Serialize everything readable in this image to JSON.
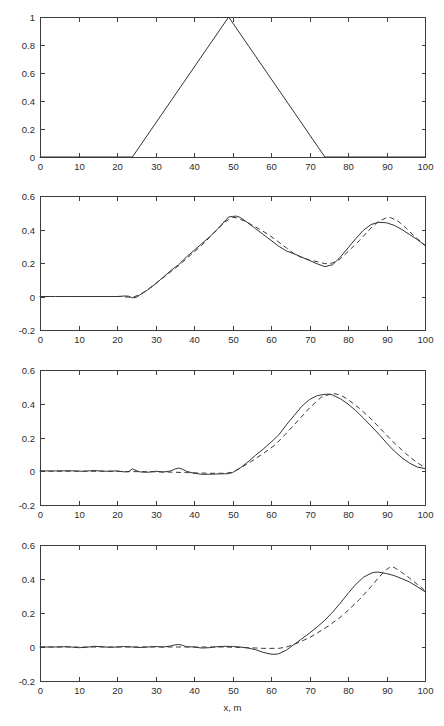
{
  "figure": {
    "title": "",
    "background": "#ffffff",
    "axis_color": "#3d3d3d",
    "solid_color": "#333333",
    "dashed_color": "#3a3a3a",
    "xlabel": "x, m",
    "panel_count": 4
  },
  "chart_data": [
    {
      "type": "line",
      "panel": 1,
      "title": "",
      "xlabel": "",
      "ylabel": "",
      "xlim": [
        0,
        100
      ],
      "ylim": [
        0,
        1
      ],
      "xticks": [
        0,
        10,
        20,
        30,
        40,
        50,
        60,
        70,
        80,
        90,
        100
      ],
      "xticklabels": [
        "0",
        "10",
        "20",
        "30",
        "40",
        "50",
        "60",
        "70",
        "80",
        "90",
        "100"
      ],
      "yticks": [
        0,
        0.2,
        0.4,
        0.6,
        0.8,
        1
      ],
      "yticklabels": [
        "0",
        "0.2",
        "0.4",
        "0.6",
        "0.8",
        "1"
      ],
      "grid": false,
      "legend": null,
      "series": [
        {
          "name": "initial triangular pulse",
          "style": "solid",
          "x": [
            0,
            24,
            49,
            74,
            100
          ],
          "y": [
            0,
            0,
            1,
            0,
            0
          ]
        }
      ]
    },
    {
      "type": "line",
      "panel": 2,
      "title": "",
      "xlabel": "",
      "ylabel": "",
      "xlim": [
        0,
        100
      ],
      "ylim": [
        -0.2,
        0.6
      ],
      "xticks": [
        0,
        10,
        20,
        30,
        40,
        50,
        60,
        70,
        80,
        90,
        100
      ],
      "xticklabels": [
        "0",
        "10",
        "20",
        "30",
        "40",
        "50",
        "60",
        "70",
        "80",
        "90",
        "100"
      ],
      "yticks": [
        -0.2,
        0,
        0.2,
        0.4,
        0.6
      ],
      "yticklabels": [
        "-0.2",
        "0",
        "0.2",
        "0.4",
        "0.6"
      ],
      "grid": false,
      "legend": null,
      "series": [
        {
          "name": "numerical",
          "style": "solid",
          "x": [
            0,
            4,
            8,
            12,
            16,
            18,
            20,
            22,
            23,
            24,
            25,
            26,
            28,
            30,
            32,
            34,
            36,
            38,
            40,
            42,
            44,
            46,
            48,
            49,
            50,
            51,
            52,
            54,
            56,
            58,
            60,
            62,
            64,
            66,
            68,
            70,
            72,
            74,
            76,
            78,
            80,
            82,
            84,
            86,
            88,
            90,
            92,
            94,
            96,
            98,
            100
          ],
          "y": [
            0.0,
            0.0,
            0.0,
            0.0,
            0.0,
            0.0,
            0.0,
            0.003,
            0.002,
            -0.008,
            -0.005,
            0.01,
            0.04,
            0.075,
            0.115,
            0.155,
            0.19,
            0.235,
            0.275,
            0.315,
            0.355,
            0.4,
            0.45,
            0.475,
            0.478,
            0.48,
            0.472,
            0.44,
            0.405,
            0.37,
            0.335,
            0.3,
            0.272,
            0.255,
            0.235,
            0.215,
            0.195,
            0.178,
            0.19,
            0.235,
            0.29,
            0.345,
            0.395,
            0.43,
            0.443,
            0.44,
            0.425,
            0.4,
            0.37,
            0.34,
            0.305
          ]
        },
        {
          "name": "analytical",
          "style": "dashed",
          "x": [
            0,
            6,
            12,
            18,
            21,
            23,
            24,
            26,
            28,
            30,
            33,
            36,
            39,
            42,
            45,
            48,
            50,
            51,
            53,
            56,
            59,
            62,
            64,
            66,
            68,
            70,
            72,
            74,
            76,
            78,
            80,
            83,
            86,
            88,
            90,
            91,
            93,
            95,
            97,
            100
          ],
          "y": [
            0.0,
            0.0,
            0.0,
            0.0,
            0.0,
            -0.004,
            -0.006,
            0.012,
            0.042,
            0.077,
            0.13,
            0.185,
            0.245,
            0.305,
            0.375,
            0.445,
            0.472,
            0.47,
            0.452,
            0.415,
            0.375,
            0.325,
            0.29,
            0.255,
            0.232,
            0.218,
            0.208,
            0.196,
            0.2,
            0.225,
            0.268,
            0.335,
            0.41,
            0.45,
            0.47,
            0.472,
            0.45,
            0.41,
            0.365,
            0.305
          ]
        }
      ]
    },
    {
      "type": "line",
      "panel": 3,
      "title": "",
      "xlabel": "",
      "ylabel": "",
      "xlim": [
        0,
        100
      ],
      "ylim": [
        -0.2,
        0.6
      ],
      "xticks": [
        0,
        10,
        20,
        30,
        40,
        50,
        60,
        70,
        80,
        90,
        100
      ],
      "xticklabels": [
        "0",
        "10",
        "20",
        "30",
        "40",
        "50",
        "60",
        "70",
        "80",
        "90",
        "100"
      ],
      "yticks": [
        -0.2,
        0,
        0.2,
        0.4,
        0.6
      ],
      "yticklabels": [
        "-0.2",
        "0",
        "0.2",
        "0.4",
        "0.6"
      ],
      "grid": false,
      "legend": null,
      "series": [
        {
          "name": "numerical",
          "style": "solid",
          "x": [
            0,
            4,
            8,
            11,
            14,
            17,
            20,
            22,
            23,
            24,
            25,
            26,
            28,
            30,
            32,
            34,
            35,
            36,
            37,
            38,
            40,
            42,
            44,
            46,
            48,
            49,
            50,
            52,
            54,
            56,
            58,
            60,
            62,
            64,
            66,
            68,
            70,
            72,
            74,
            75,
            76,
            78,
            80,
            82,
            84,
            86,
            88,
            90,
            92,
            94,
            96,
            98,
            100
          ],
          "y": [
            0.002,
            0.002,
            0.003,
            0.0,
            0.004,
            0.0,
            0.002,
            -0.004,
            -0.003,
            0.014,
            0.004,
            -0.004,
            -0.006,
            0.0,
            -0.005,
            0.002,
            0.013,
            0.019,
            0.012,
            0.0,
            -0.012,
            -0.018,
            -0.018,
            -0.016,
            -0.015,
            -0.014,
            -0.008,
            0.02,
            0.055,
            0.095,
            0.132,
            0.172,
            0.215,
            0.275,
            0.33,
            0.385,
            0.425,
            0.448,
            0.456,
            0.457,
            0.452,
            0.43,
            0.398,
            0.36,
            0.315,
            0.268,
            0.22,
            0.168,
            0.12,
            0.08,
            0.048,
            0.025,
            0.016
          ]
        },
        {
          "name": "analytical",
          "style": "dashed",
          "x": [
            0,
            8,
            16,
            24,
            32,
            38,
            44,
            48,
            50,
            52,
            55,
            58,
            61,
            64,
            67,
            70,
            73,
            76,
            78,
            80,
            83,
            86,
            89,
            92,
            95,
            98,
            100
          ],
          "y": [
            0.0,
            0.0,
            0.0,
            -0.002,
            -0.004,
            -0.008,
            -0.012,
            -0.012,
            -0.006,
            0.018,
            0.06,
            0.105,
            0.155,
            0.225,
            0.3,
            0.375,
            0.438,
            0.462,
            0.452,
            0.425,
            0.372,
            0.31,
            0.238,
            0.168,
            0.105,
            0.05,
            0.022
          ]
        }
      ]
    },
    {
      "type": "line",
      "panel": 4,
      "title": "",
      "xlabel": "x, m",
      "ylabel": "",
      "xlim": [
        0,
        100
      ],
      "ylim": [
        -0.2,
        0.6
      ],
      "xticks": [
        0,
        10,
        20,
        30,
        40,
        50,
        60,
        70,
        80,
        90,
        100
      ],
      "xticklabels": [
        "0",
        "10",
        "20",
        "30",
        "40",
        "50",
        "60",
        "70",
        "80",
        "90",
        "100"
      ],
      "yticks": [
        -0.2,
        0,
        0.2,
        0.4,
        0.6
      ],
      "yticklabels": [
        "-0.2",
        "0",
        "0.2",
        "0.4",
        "0.6"
      ],
      "grid": false,
      "legend": null,
      "series": [
        {
          "name": "numerical",
          "style": "solid",
          "x": [
            0,
            4,
            7,
            10,
            12,
            14,
            16,
            18,
            20,
            22,
            24,
            26,
            28,
            30,
            32,
            34,
            35,
            36,
            37,
            38,
            40,
            42,
            44,
            46,
            48,
            50,
            52,
            54,
            56,
            58,
            60,
            61,
            62,
            64,
            66,
            68,
            70,
            72,
            74,
            76,
            78,
            80,
            82,
            84,
            86,
            87,
            88,
            90,
            92,
            94,
            96,
            98,
            100
          ],
          "y": [
            0.0,
            0.0,
            0.002,
            -0.004,
            -0.002,
            0.004,
            0.002,
            -0.002,
            0.0,
            0.003,
            0.0,
            -0.003,
            0.0,
            0.003,
            0.0,
            0.006,
            0.012,
            0.015,
            0.01,
            0.002,
            0.0,
            -0.006,
            -0.004,
            0.002,
            0.004,
            0.003,
            0.0,
            -0.006,
            -0.016,
            -0.032,
            -0.042,
            -0.043,
            -0.04,
            -0.018,
            0.015,
            0.048,
            0.082,
            0.118,
            0.158,
            0.205,
            0.258,
            0.315,
            0.368,
            0.41,
            0.434,
            0.44,
            0.44,
            0.432,
            0.42,
            0.402,
            0.382,
            0.355,
            0.325
          ]
        },
        {
          "name": "analytical",
          "style": "dashed",
          "x": [
            0,
            10,
            20,
            30,
            40,
            48,
            54,
            58,
            62,
            64,
            66,
            68,
            70,
            72,
            75,
            78,
            80,
            83,
            86,
            88,
            90,
            91,
            92,
            94,
            96,
            98,
            100
          ],
          "y": [
            0.0,
            0.0,
            0.0,
            0.0,
            0.0,
            0.0,
            -0.004,
            -0.008,
            -0.008,
            0.0,
            0.015,
            0.035,
            0.055,
            0.082,
            0.125,
            0.175,
            0.215,
            0.28,
            0.355,
            0.41,
            0.455,
            0.472,
            0.468,
            0.438,
            0.405,
            0.368,
            0.332
          ]
        }
      ]
    }
  ]
}
